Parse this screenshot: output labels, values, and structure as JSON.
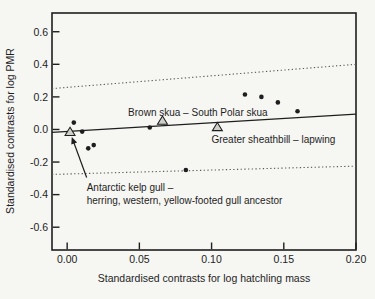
{
  "colors": {
    "paper": "#f6f6f3",
    "ink": "#1e1e1e",
    "dotted_line": "#5a5a5a",
    "triangle_fill": "#cfcfca"
  },
  "chart_data": {
    "type": "scatter",
    "title": "",
    "xlabel": "Standardised contrasts for log hatchling mass",
    "ylabel": "Standardised contrasts for log PMR",
    "xlim": [
      -0.0105,
      0.2
    ],
    "ylim": [
      -0.74,
      0.715
    ],
    "grid": false,
    "legend": "none",
    "x_ticks": [
      {
        "v": 0.0,
        "label": "0.00"
      },
      {
        "v": 0.05,
        "label": "0.05"
      },
      {
        "v": 0.1,
        "label": "0.10"
      },
      {
        "v": 0.15,
        "label": "0.15"
      },
      {
        "v": 0.2,
        "label": "0.20"
      }
    ],
    "y_ticks": [
      {
        "v": 0.6,
        "label": "0.6"
      },
      {
        "v": 0.4,
        "label": "0.4"
      },
      {
        "v": 0.2,
        "label": "0.2"
      },
      {
        "v": 0.0,
        "label": "0.0"
      },
      {
        "v": -0.2,
        "label": "-0.2"
      },
      {
        "v": -0.4,
        "label": "-0.4"
      },
      {
        "v": -0.6,
        "label": "-0.6"
      }
    ],
    "series": [
      {
        "name": "species-pair-contrast",
        "marker": "circle",
        "points": [
          [
            0.0046,
            0.042
          ],
          [
            0.0104,
            -0.013
          ],
          [
            0.0146,
            -0.116
          ],
          [
            0.0184,
            -0.096
          ],
          [
            0.0572,
            0.012
          ],
          [
            0.0822,
            -0.249
          ],
          [
            0.1231,
            0.215
          ],
          [
            0.1345,
            0.2
          ],
          [
            0.1459,
            0.166
          ],
          [
            0.1595,
            0.112
          ]
        ]
      },
      {
        "name": "highlighted-contrast",
        "marker": "triangle",
        "points": [
          [
            0.002,
            -0.015
          ],
          [
            0.066,
            0.054
          ],
          [
            0.104,
            0.015
          ]
        ]
      }
    ],
    "lines": [
      {
        "name": "upper-confidence-band",
        "style": "dotted",
        "x1": -0.0105,
        "y1": 0.251,
        "x2": 0.2,
        "y2": 0.4
      },
      {
        "name": "lower-confidence-band",
        "style": "dotted",
        "x1": -0.0105,
        "y1": -0.276,
        "x2": 0.2,
        "y2": -0.225
      },
      {
        "name": "regression-line",
        "style": "solid",
        "x1": -0.0105,
        "y1": -0.018,
        "x2": 0.2,
        "y2": 0.094
      }
    ],
    "annotations": [
      {
        "name": "brown-skua-label",
        "text": "Brown skua – South Polar skua",
        "x": 0.0905,
        "y": 0.107,
        "anchor": "middle"
      },
      {
        "name": "sheathbill-label",
        "text": "Greater sheathbill – lapwing",
        "x": 0.1428,
        "y": -0.062,
        "anchor": "middle"
      },
      {
        "name": "kelp-gull-label",
        "lines": [
          "Antarctic kelp gull –",
          "herring, western, yellow-footed gull ancestor"
        ],
        "x": 0.0135,
        "y": -0.358,
        "anchor": "start"
      }
    ],
    "arrow": {
      "x1": 0.0135,
      "y1": -0.295,
      "x2": 0.0032,
      "y2": -0.046
    }
  }
}
